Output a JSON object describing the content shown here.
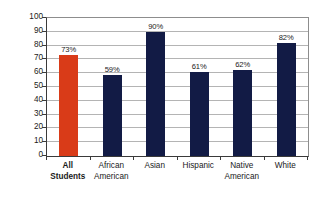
{
  "chart_data": {
    "type": "bar",
    "title": "",
    "xlabel": "",
    "ylabel": "Graduation Rate (percent)",
    "categories": [
      "All Students",
      "African American",
      "Asian",
      "Hispanic",
      "Native American",
      "White"
    ],
    "category_lines": [
      [
        "All",
        "Students"
      ],
      [
        "African",
        "American"
      ],
      [
        "Asian",
        ""
      ],
      [
        "Hispanic",
        ""
      ],
      [
        "Native",
        "American"
      ],
      [
        "White",
        ""
      ]
    ],
    "values": [
      73,
      59,
      90,
      61,
      62,
      82
    ],
    "data_labels": [
      "73%",
      "59%",
      "90%",
      "61%",
      "62%",
      "82%"
    ],
    "bar_colors": [
      "#d93b18",
      "#121b45",
      "#121b45",
      "#121b45",
      "#121b45",
      "#121b45"
    ],
    "highlight_index": 0,
    "ylim": [
      0,
      100
    ],
    "ytick_step": 10,
    "yticks": [
      0,
      10,
      20,
      30,
      40,
      50,
      60,
      70,
      80,
      90,
      100
    ],
    "ytick_labels": [
      "0",
      "10",
      "20",
      "30",
      "40",
      "50",
      "60",
      "70",
      "80",
      "90",
      "100"
    ],
    "grid": true,
    "legend": "none",
    "accent_color": "#d93b18",
    "series_color": "#121b45",
    "gridline_color": "#b4b4b4",
    "axis_color": "#3a3a3a",
    "background": "#ffffff"
  }
}
